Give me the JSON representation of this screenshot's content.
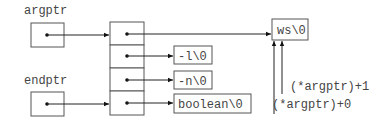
{
  "diagram": {
    "variables": [
      {
        "name": "argptr",
        "label": "argptr"
      },
      {
        "name": "endptr",
        "label": "endptr"
      }
    ],
    "array_cells": 4,
    "strings": [
      {
        "id": "ws",
        "text": "ws\\0"
      },
      {
        "id": "minus-l",
        "text": "-l\\0"
      },
      {
        "id": "minus-n",
        "text": "-n\\0"
      },
      {
        "id": "boolean",
        "text": "boolean\\0"
      }
    ],
    "annotations": [
      {
        "id": "argptr-plus-1",
        "text": "(*argptr)+1"
      },
      {
        "id": "argptr-plus-0",
        "text": "(*argptr)+0"
      }
    ]
  }
}
